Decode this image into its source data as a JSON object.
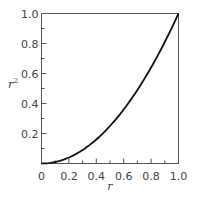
{
  "chart_data": {
    "type": "line",
    "title": "",
    "xlabel": "r",
    "ylabel": "r²",
    "xlim": [
      0,
      1
    ],
    "ylim": [
      0,
      1
    ],
    "grid": false,
    "legend": null,
    "x_ticks": [
      "0",
      "0.2",
      "0.4",
      "0.6",
      "0.8",
      "1.0"
    ],
    "y_ticks": [
      "0.2",
      "0.4",
      "0.6",
      "0.8",
      "1.0"
    ],
    "minor_tick_step": 0.1,
    "series": [
      {
        "name": "r^2",
        "x": [
          0,
          0.1,
          0.2,
          0.3,
          0.4,
          0.5,
          0.6,
          0.7,
          0.8,
          0.9,
          1.0
        ],
        "values": [
          0,
          0.01,
          0.04,
          0.09,
          0.16,
          0.25,
          0.36,
          0.49,
          0.64,
          0.81,
          1.0
        ]
      }
    ]
  },
  "colors": {
    "axis": "#555555",
    "curve": "#111111",
    "text": "#444444"
  }
}
